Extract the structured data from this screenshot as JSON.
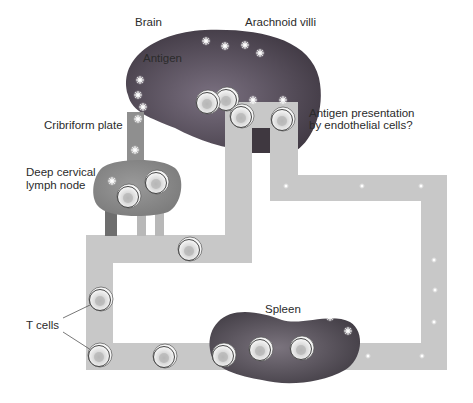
{
  "diagram": {
    "labels": {
      "brain": "Brain",
      "arachnoid_villi": "Arachnoid villi",
      "antigen": "Antigen",
      "cribriform_plate": "Cribriform plate",
      "deep_cervical_line1": "Deep cervical",
      "deep_cervical_line2": "lymph node",
      "antigen_presentation_line1": "Antigen presentation",
      "antigen_presentation_line2": "by endothelial cells?",
      "spleen": "Spleen",
      "t_cells": "T cells"
    },
    "colors": {
      "brain": "#4e4550",
      "brain_highlight": "#7a7080",
      "lymph_node": "#8a8a8a",
      "spleen": "#555058",
      "vessel": "#c9c9c9",
      "vessel_dark": "#6a6a6a",
      "text": "#2b2b2b"
    },
    "counts": {
      "t_cells_total": 13,
      "antigen_markers_in_brain": 9,
      "antigen_markers_in_spleen": 2
    }
  }
}
